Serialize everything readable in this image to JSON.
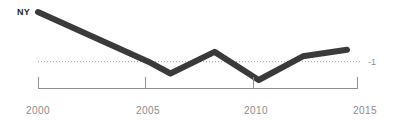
{
  "chart_data": {
    "type": "line",
    "title": "",
    "subtitle": "",
    "series_label": "NY",
    "xlabel": "",
    "ylabel": "",
    "xlim": [
      2000,
      2015
    ],
    "ylim": [
      -2.6,
      1.4
    ],
    "grid": false,
    "legend_position": "inline-start-label",
    "x": [
      2000,
      2005,
      2006,
      2008,
      2010,
      2012,
      2014
    ],
    "values": [
      1.3,
      -1.0,
      -1.55,
      -0.55,
      -1.85,
      -0.75,
      -0.45
    ],
    "series": [
      {
        "name": "NY",
        "x": [
          2000,
          2005,
          2006,
          2008,
          2010,
          2012,
          2014
        ],
        "values": [
          1.3,
          -1.0,
          -1.55,
          -0.55,
          -1.85,
          -0.75,
          -0.45
        ],
        "color": "#3a3a3a"
      }
    ],
    "reference_line": {
      "value": -1,
      "label": "-1",
      "style": "dotted",
      "color": "#9a9a9a"
    },
    "xticks": [
      2000,
      2005,
      2010,
      2015
    ],
    "xtick_labels": [
      "2000",
      "2005",
      "2010",
      "2015"
    ],
    "yticks": [
      -1
    ],
    "ytick_labels": [
      "-1"
    ],
    "colors": {
      "line": "#3a3a3a",
      "axis": "#8f8f8f",
      "tick_text": "#8c8c8c",
      "reference": "#9a9a9a",
      "series_label": "#262626",
      "background": "#ffffff"
    }
  },
  "axis": {
    "x_labels": [
      "2000",
      "2005",
      "2010",
      "2015"
    ],
    "reference_label": "-1",
    "series_label": "NY"
  }
}
